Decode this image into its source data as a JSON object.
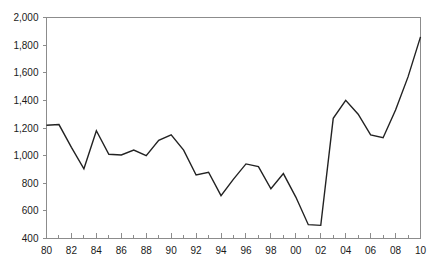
{
  "chart_data": {
    "type": "line",
    "title": "",
    "subtitle": "",
    "xlabel": "",
    "ylabel": "",
    "xlim": [
      1980,
      2010
    ],
    "ylim": [
      400,
      2000
    ],
    "y_ticks": [
      400,
      600,
      800,
      1000,
      1200,
      1400,
      1600,
      1800,
      2000
    ],
    "y_tick_labels": [
      "400",
      "600",
      "800",
      "1,000",
      "1,200",
      "1,400",
      "1,600",
      "1,800",
      "2,000"
    ],
    "x_ticks": [
      1980,
      1982,
      1984,
      1986,
      1988,
      1990,
      1992,
      1994,
      1996,
      1998,
      2000,
      2002,
      2004,
      2006,
      2008,
      2010
    ],
    "x_tick_labels": [
      "80",
      "82",
      "84",
      "86",
      "88",
      "90",
      "92",
      "94",
      "96",
      "98",
      "00",
      "02",
      "04",
      "06",
      "08",
      "10"
    ],
    "x_minor_ticks": [
      1981,
      1983,
      1985,
      1987,
      1989,
      1991,
      1993,
      1995,
      1997,
      1999,
      2001,
      2003,
      2005,
      2007,
      2009
    ],
    "grid": false,
    "legend": false,
    "legend_position": "none",
    "line_color": "#222222",
    "axis_color": "#8c8c8c",
    "x": [
      1980,
      1981,
      1982,
      1983,
      1984,
      1985,
      1986,
      1987,
      1988,
      1989,
      1990,
      1991,
      1992,
      1993,
      1994,
      1995,
      1996,
      1997,
      1998,
      1999,
      2000,
      2001,
      2002,
      2003,
      2004,
      2005,
      2006,
      2007,
      2008,
      2009,
      2010
    ],
    "values": [
      1220,
      1225,
      1060,
      905,
      1180,
      1010,
      1005,
      1040,
      1000,
      1110,
      1150,
      1040,
      860,
      880,
      710,
      830,
      940,
      920,
      760,
      870,
      700,
      500,
      495,
      1270,
      1400,
      1300,
      1150,
      1130,
      1330,
      1570,
      1860
    ],
    "series": [
      {
        "name": "series-1",
        "values": [
          1220,
          1225,
          1060,
          905,
          1180,
          1010,
          1005,
          1040,
          1000,
          1110,
          1150,
          1040,
          860,
          880,
          710,
          830,
          940,
          920,
          760,
          870,
          700,
          500,
          495,
          1270,
          1400,
          1300,
          1150,
          1130,
          1330,
          1570,
          1860
        ]
      }
    ]
  },
  "axis": {
    "y_label_0": "400",
    "y_label_1": "600",
    "y_label_2": "800",
    "y_label_3": "1,000",
    "y_label_4": "1,200",
    "y_label_5": "1,400",
    "y_label_6": "1,600",
    "y_label_7": "1,800",
    "y_label_8": "2,000"
  }
}
